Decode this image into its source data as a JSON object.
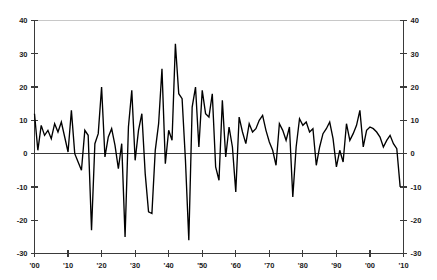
{
  "chart_data": {
    "type": "line",
    "title": "",
    "subtitle": "",
    "xlabel": "",
    "ylabel": "",
    "xlim": [
      1900,
      2010
    ],
    "ylim": [
      -30,
      40
    ],
    "grid": false,
    "legend": "none",
    "line_color": "#000000",
    "axis_color": "#3a3a3a",
    "background_color": "#ffffff",
    "y_ticks": [
      40,
      30,
      20,
      10,
      0,
      -10,
      -20,
      -30
    ],
    "y_tick_labels": [
      "40",
      "30",
      "20",
      "10",
      "0",
      "-10",
      "-20",
      "-30"
    ],
    "y_axis_right_mirrored": true,
    "x_ticks": [
      1900,
      1910,
      1920,
      1930,
      1940,
      1950,
      1960,
      1970,
      1980,
      1990,
      2000,
      2010
    ],
    "x_tick_labels": [
      "'00",
      "'10",
      "'20",
      "'30",
      "'40",
      "'50",
      "'60",
      "'70",
      "'80",
      "'90",
      "'00",
      "'10"
    ],
    "zero_line": 0,
    "series": [
      {
        "name": "annual series",
        "x": [
          1900,
          1901,
          1902,
          1903,
          1904,
          1905,
          1906,
          1907,
          1908,
          1909,
          1910,
          1911,
          1912,
          1913,
          1914,
          1915,
          1916,
          1917,
          1918,
          1919,
          1920,
          1921,
          1922,
          1923,
          1924,
          1925,
          1926,
          1927,
          1928,
          1929,
          1930,
          1931,
          1932,
          1933,
          1934,
          1935,
          1936,
          1937,
          1938,
          1939,
          1940,
          1941,
          1942,
          1943,
          1944,
          1945,
          1946,
          1947,
          1948,
          1949,
          1950,
          1951,
          1952,
          1953,
          1954,
          1955,
          1956,
          1957,
          1958,
          1959,
          1960,
          1961,
          1962,
          1963,
          1964,
          1965,
          1966,
          1967,
          1968,
          1969,
          1970,
          1971,
          1972,
          1973,
          1974,
          1975,
          1976,
          1977,
          1978,
          1979,
          1980,
          1981,
          1982,
          1983,
          1984,
          1985,
          1986,
          1987,
          1988,
          1989,
          1990,
          1991,
          1992,
          1993,
          1994,
          1995,
          1996,
          1997,
          1998,
          1999,
          2000,
          2001,
          2002,
          2003,
          2004,
          2005,
          2006,
          2007,
          2008,
          2009
        ],
        "values": [
          12.0,
          1.0,
          8.5,
          5.5,
          7.0,
          4.5,
          9.0,
          6.5,
          9.5,
          5.0,
          0.5,
          13.0,
          0.0,
          -2.5,
          -5.0,
          7.0,
          5.5,
          -23.0,
          3.0,
          6.0,
          20.0,
          -1.0,
          5.0,
          7.5,
          2.5,
          -4.5,
          3.0,
          -25.0,
          8.0,
          19.0,
          -2.0,
          7.0,
          12.0,
          -6.0,
          -17.5,
          -18.0,
          1.0,
          9.0,
          25.5,
          -3.0,
          7.0,
          4.0,
          33.0,
          18.0,
          16.5,
          -2.0,
          -26.0,
          14.0,
          20.0,
          2.0,
          19.0,
          12.0,
          11.0,
          18.0,
          -4.0,
          -8.0,
          16.0,
          -1.0,
          8.0,
          2.0,
          -11.5,
          11.0,
          6.5,
          3.0,
          9.0,
          6.5,
          7.5,
          10.0,
          11.5,
          7.0,
          3.5,
          1.0,
          -3.5,
          9.0,
          7.0,
          4.0,
          8.0,
          -13.0,
          2.0,
          10.5,
          8.5,
          9.5,
          6.5,
          7.5,
          -3.5,
          2.0,
          6.0,
          7.5,
          9.5,
          4.5,
          -4.0,
          1.0,
          -2.5,
          9.0,
          4.0,
          6.0,
          8.5,
          13.0,
          2.0,
          7.0,
          8.0,
          7.5,
          6.5,
          5.0,
          2.0,
          4.0,
          5.5,
          3.0,
          1.5,
          -10.0
        ]
      }
    ]
  }
}
